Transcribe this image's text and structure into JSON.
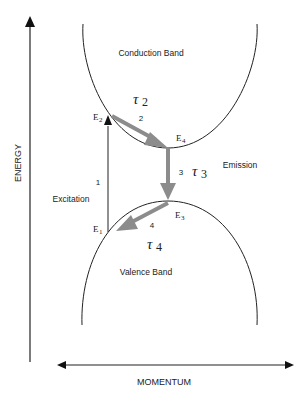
{
  "diagram": {
    "axes": {
      "y_label": "ENERGY",
      "x_label": "MOMENTUM"
    },
    "bands": {
      "conduction": "Conduction Band",
      "valence": "Valence Band"
    },
    "levels": {
      "e1": {
        "base": "E",
        "sub": "1"
      },
      "e2": {
        "base": "E",
        "sub": "2"
      },
      "e3": {
        "base": "E",
        "sub": "3"
      },
      "e4": {
        "base": "E",
        "sub": "4"
      }
    },
    "transitions": {
      "excitation": {
        "step": "1",
        "label": "Excitation"
      },
      "relax_conduction": {
        "step": "2",
        "tau": {
          "base": "τ",
          "sub": "2"
        }
      },
      "emission": {
        "step": "3",
        "label": "Emission",
        "tau": {
          "base": "τ",
          "sub": "3"
        }
      },
      "relax_valence": {
        "step": "4",
        "tau": {
          "base": "τ",
          "sub": "4"
        }
      }
    },
    "colors": {
      "line": "#222222",
      "transition_arrow": "#8c8c8c"
    }
  }
}
